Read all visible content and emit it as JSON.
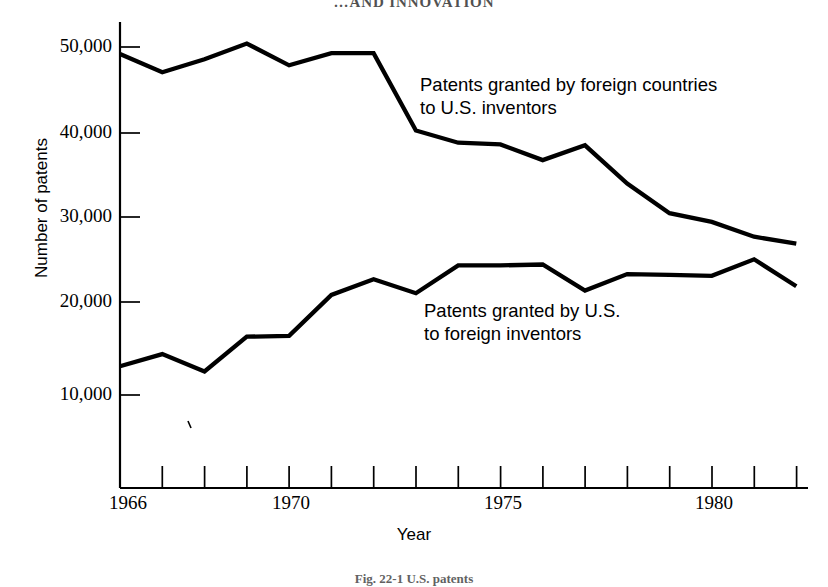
{
  "page": {
    "running_head": "…AND INNOVATION",
    "figure_caption": "Fig. 22-1 U.S. patents"
  },
  "chart_data": {
    "type": "line",
    "title": "",
    "xlabel": "Year",
    "ylabel": "Number of patents",
    "xlim": [
      1966,
      1982
    ],
    "ylim": [
      5000,
      52000
    ],
    "grid": false,
    "legend_position": "inline-annotation",
    "y_ticks": [
      10000,
      20000,
      30000,
      40000,
      50000
    ],
    "y_tick_labels": [
      "10,000",
      "20,000",
      "30,000",
      "40,000",
      "50,000"
    ],
    "x_ticks": [
      1966,
      1967,
      1968,
      1969,
      1970,
      1971,
      1972,
      1973,
      1974,
      1975,
      1976,
      1977,
      1978,
      1979,
      1980,
      1981,
      1982
    ],
    "x_tick_labels_shown": [
      {
        "year": 1966,
        "label": "1966"
      },
      {
        "year": 1970,
        "label": "1970"
      },
      {
        "year": 1975,
        "label": "1975"
      },
      {
        "year": 1980,
        "label": "1980"
      }
    ],
    "x": [
      1966,
      1967,
      1968,
      1969,
      1970,
      1971,
      1972,
      1973,
      1974,
      1975,
      1976,
      1977,
      1978,
      1979,
      1980,
      1981,
      1982
    ],
    "series": [
      {
        "name": "Patents granted by foreign countries to U.S. inventors",
        "annotation": "Patents granted by foreign countries\nto U.S. inventors",
        "annotation_line1": "Patents granted by foreign countries",
        "annotation_line2": "to U.S. inventors",
        "color": "#000000",
        "values": [
          49200,
          47100,
          48600,
          50400,
          47900,
          49300,
          49300,
          40400,
          39000,
          38800,
          37000,
          38700,
          34300,
          30900,
          29900,
          28200,
          27400
        ]
      },
      {
        "name": "Patents granted by U.S. to foreign inventors",
        "annotation": "Patents granted by U.S.\nto foreign inventors",
        "annotation_line1": "Patents granted by U.S.",
        "annotation_line2": "to foreign inventors",
        "color": "#000000",
        "values": [
          13300,
          14700,
          12700,
          16700,
          16800,
          21500,
          23300,
          21700,
          24900,
          24900,
          25000,
          22000,
          23900,
          23800,
          23700,
          25600,
          22500
        ]
      }
    ]
  }
}
